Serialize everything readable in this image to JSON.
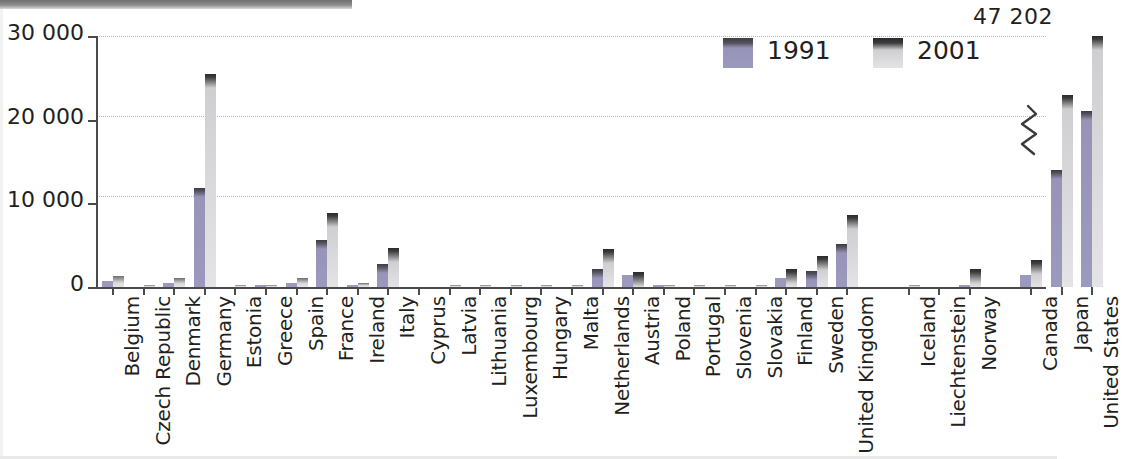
{
  "chart_data": {
    "type": "bar",
    "title": "",
    "subtitle": "",
    "xlabel": "",
    "ylabel": "",
    "ylim": [
      0,
      30000
    ],
    "yticks": [
      "0",
      "10 000",
      "20 000",
      "30 000"
    ],
    "ytick_values": [
      0,
      10000,
      20000,
      30000
    ],
    "grid": true,
    "legend_position": "top-right",
    "categories": [
      "Belgium",
      "Czech Republic",
      "Denmark",
      "Germany",
      "Estonia",
      "Greece",
      "Spain",
      "France",
      "Ireland",
      "Italy",
      "Cyprus",
      "Latvia",
      "Lithuania",
      "Luxembourg",
      "Hungary",
      "Malta",
      "Netherlands",
      "Austria",
      "Poland",
      "Portugal",
      "Slovenia",
      "Slovakia",
      "Finland",
      "Sweden",
      "United Kingdom",
      "Iceland",
      "Liechtenstein",
      "Norway",
      "Canada",
      "Japan",
      "United States"
    ],
    "series": [
      {
        "name": "1991",
        "color": "#9b99bd",
        "values": [
          700,
          0,
          500,
          11800,
          0,
          60,
          450,
          5600,
          140,
          2700,
          0,
          0,
          0,
          0,
          0,
          0,
          2200,
          1400,
          60,
          0,
          0,
          0,
          1100,
          1900,
          5100,
          0,
          0,
          200,
          1400,
          14000,
          21000
        ]
      },
      {
        "name": "2001",
        "color": "#e4e4e6",
        "values": [
          1300,
          120,
          1050,
          25500,
          30,
          260,
          1050,
          8900,
          500,
          4700,
          0,
          20,
          20,
          70,
          100,
          10,
          4500,
          1850,
          180,
          110,
          60,
          60,
          2100,
          3700,
          8600,
          40,
          0,
          2100,
          3200,
          23000,
          47202
        ]
      }
    ],
    "annotations": [
      {
        "text": "47 202",
        "series": "2001",
        "category": "United States",
        "note": "bar exceeds axis; break mark drawn on bar"
      }
    ]
  },
  "legend": {
    "items": [
      {
        "label": "1991",
        "swatch": "legend-swatch-1991"
      },
      {
        "label": "2001",
        "swatch": "legend-swatch-2001"
      }
    ]
  },
  "overflow": {
    "label": "47 202"
  }
}
